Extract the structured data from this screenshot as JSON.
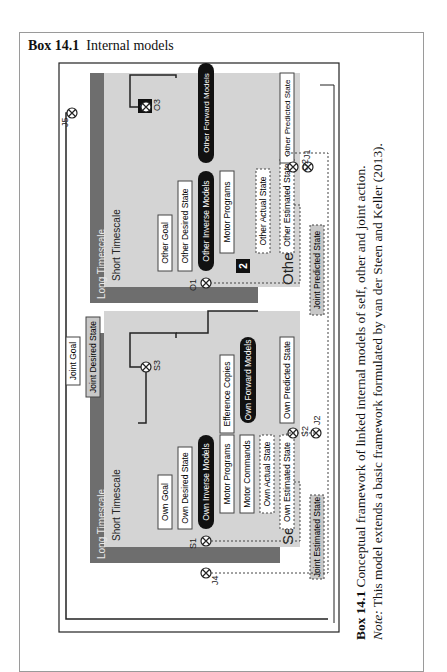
{
  "box": {
    "number": "Box 14.1",
    "title": "Internal models"
  },
  "panels": {
    "self": {
      "name": "Sefl",
      "long_timescale": "Long Timescale",
      "short_timescale": "Short Timescale",
      "nodes": {
        "goal": "Own Goal",
        "desired": "Own Desired State",
        "inverse": "Own Inverse Models",
        "motor_programs": "Motor Programs",
        "motor_commands": "Motor Commands",
        "efference": "Efference Copies",
        "forward": "Own Forward Models",
        "actual": "Own Actual State",
        "estimated": "Own Estimated State",
        "predicted": "Own Predicted State"
      },
      "comparators": {
        "s1": "S1",
        "s2": "S2",
        "s3": "S3"
      }
    },
    "other": {
      "name": "Other",
      "long_timescale": "Long Timescale",
      "short_timescale": "Short Timescale",
      "badge_1": "1",
      "badge_2": "2",
      "nodes": {
        "goal": "Other Goal",
        "desired": "Other Desired State",
        "inverse": "Other Inverse Models",
        "motor_programs": "Motor Programs",
        "forward": "Other Forward Models",
        "actual": "Other Actual State",
        "estimated": "Other Estimated State",
        "predicted": "Other Predicted State"
      },
      "comparators": {
        "o1": "O1",
        "o2": "O2",
        "o3": "O3"
      }
    }
  },
  "joint": {
    "goal": "Joint Goal",
    "desired": "Joint Desired State",
    "estimated": "Joint Estimated State",
    "predicted": "Joint Predicted State",
    "comparators": {
      "j1": "J1",
      "j2": "J2",
      "j4": "J4",
      "j5": "J5"
    }
  },
  "colors": {
    "long_timescale": "#6e6e6e",
    "short_timescale": "#d4d4d4",
    "joint_box": "#c8c8c8",
    "model_pill": "#111111"
  },
  "caption": {
    "label": "Box 14.1",
    "text": " Conceptual framework of linked internal models of self, other and joint action.",
    "note_label": "Note:",
    "note_text": " This model extends a basic framework formulated by van der Steen and Keller (2013)."
  }
}
